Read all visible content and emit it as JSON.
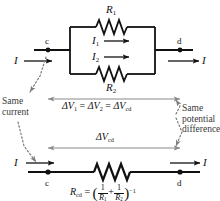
{
  "figure": {
    "colors": {
      "wire": "#111111",
      "arrow_gray": "#8a8a8a",
      "annotation_text": "#3a3a3a",
      "background": "#ffffff"
    }
  },
  "top_circuit": {
    "current_in_label": "I",
    "current_out_label": "I",
    "node_left_label": "c",
    "node_right_label": "d",
    "branches": [
      {
        "resistor_label": "R",
        "resistor_sub": "1",
        "current_label": "I",
        "current_sub": "1"
      },
      {
        "resistor_label": "R",
        "resistor_sub": "2",
        "current_label": "I",
        "current_sub": "2"
      }
    ]
  },
  "annotations": {
    "left": {
      "line1": "Same",
      "line2": "current"
    },
    "right": {
      "line1": "Same",
      "line2": "potential",
      "line3": "difference"
    }
  },
  "equations": {
    "voltage_equality": {
      "term1_sym": "ΔV",
      "term1_sub": "1",
      "term2_sym": "ΔV",
      "term2_sub": "2",
      "term3_sym": "ΔV",
      "term3_sub": "cd",
      "eq1": "=",
      "eq2": "="
    },
    "delta_v_cd": {
      "sym": "ΔV",
      "sub": "cd"
    },
    "r_cd": {
      "lhs_sym": "R",
      "lhs_sub": "cd",
      "equals": "=",
      "open_paren": "(",
      "close_paren": ")",
      "frac1_num": "1",
      "frac1_den": "R",
      "frac1_den_sub": "1",
      "plus": "+",
      "frac2_num": "1",
      "frac2_den": "R",
      "frac2_den_sub": "2",
      "exponent": "−1"
    }
  },
  "bottom_circuit": {
    "current_in_label": "I",
    "current_out_label": "I",
    "node_left_label": "c",
    "node_right_label": "d"
  }
}
